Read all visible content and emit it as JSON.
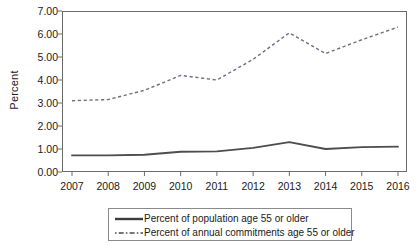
{
  "chart_data": {
    "type": "line",
    "title": "",
    "xlabel": "",
    "ylabel": "Percent",
    "categories": [
      "2007",
      "2008",
      "2009",
      "2010",
      "2011",
      "2012",
      "2013",
      "2014",
      "2015",
      "2016"
    ],
    "ylim": [
      0.0,
      7.0
    ],
    "ytick_labels": [
      "0.00",
      "1.00",
      "2.00",
      "3.00",
      "4.00",
      "5.00",
      "6.00",
      "7.00"
    ],
    "ytick_values": [
      0.0,
      1.0,
      2.0,
      3.0,
      4.0,
      5.0,
      6.0,
      7.0
    ],
    "grid": false,
    "legend_position": "below-center",
    "series": [
      {
        "name": "Percent of population age 55 or older",
        "style": "solid",
        "color": "#4d4d4d",
        "values": [
          0.72,
          0.72,
          0.75,
          0.88,
          0.9,
          1.05,
          1.3,
          1.0,
          1.08,
          1.1
        ]
      },
      {
        "name": "Percent of annual commitments age 55 or older",
        "style": "dashed",
        "color": "#6e6e86",
        "values": [
          3.1,
          3.15,
          3.55,
          4.2,
          4.0,
          4.9,
          6.05,
          5.15,
          5.75,
          6.3
        ]
      }
    ]
  },
  "legend": {
    "entries": [
      {
        "label": "Percent of population age 55 or older"
      },
      {
        "label": "Percent of annual commitments age 55 or older"
      }
    ]
  },
  "colors": {
    "axis": "#6b6b6b",
    "solid_series": "#4d4d4d",
    "dashed_series": "#6e6e86",
    "text": "#1a1a1a",
    "background": "#ffffff"
  }
}
